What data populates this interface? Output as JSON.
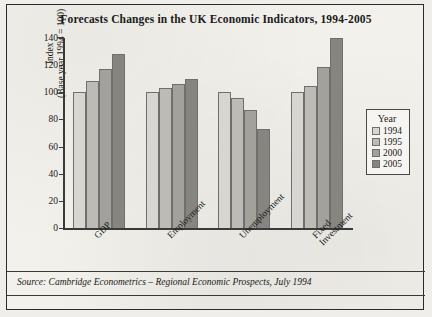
{
  "figure": {
    "title": "Forecasts Changes in the UK Economic Indicators, 1994-2005",
    "source": "Source: Cambridge Econometrics – Regional Economic Prospects, July 1994"
  },
  "legend": {
    "title": "Year",
    "position": "right"
  },
  "ylabel_lines": {
    "line1": "Index",
    "line2": "(Base year 1994 = 100)"
  },
  "chart_data": {
    "type": "bar",
    "title": "Forecasts Changes in the UK Economic Indicators, 1994-2005",
    "xlabel": "",
    "ylabel": "Index (Base year 1994 = 100)",
    "ylim": [
      0,
      140
    ],
    "yticks": [
      0,
      20,
      40,
      60,
      80,
      100,
      120,
      140
    ],
    "grid": false,
    "legend_position": "right",
    "categories": [
      "GDP",
      "Employment",
      "Unemployment",
      "Fixed Investment"
    ],
    "category_label_lines": [
      [
        "GDP"
      ],
      [
        "Employment"
      ],
      [
        "Unemployment"
      ],
      [
        "Fixed",
        "Investment"
      ]
    ],
    "series": [
      {
        "name": "1994",
        "color": "#d8d6d0",
        "values": [
          100,
          100,
          100,
          100
        ]
      },
      {
        "name": "1995",
        "color": "#bdbbb5",
        "values": [
          108,
          103,
          96,
          105
        ]
      },
      {
        "name": "2000",
        "color": "#a3a19b",
        "values": [
          117,
          106,
          87,
          119
        ]
      },
      {
        "name": "2005",
        "color": "#87857f",
        "values": [
          128,
          110,
          73,
          140
        ]
      }
    ]
  }
}
